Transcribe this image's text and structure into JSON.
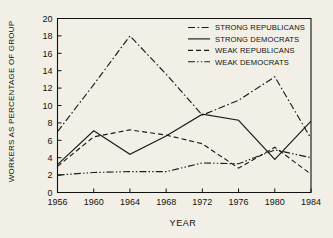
{
  "chart_data": {
    "type": "line",
    "title": "",
    "xlabel": "YEAR",
    "ylabel": "WORKERS AS PERCENTAGE OF GROUP",
    "x": [
      1956,
      1960,
      1964,
      1968,
      1972,
      1976,
      1980,
      1984
    ],
    "xlim": [
      1956,
      1984
    ],
    "ylim": [
      0,
      20
    ],
    "ytick_labels": [
      "0",
      "2",
      "4",
      "6",
      "8",
      "10",
      "12",
      "14",
      "16",
      "18",
      "20"
    ],
    "yticks": [
      0,
      2,
      4,
      6,
      8,
      10,
      12,
      14,
      16,
      18,
      20
    ],
    "xtick_labels": [
      "1956",
      "1960",
      "1964",
      "1968",
      "1972",
      "1976",
      "1980",
      "1984"
    ],
    "grid": false,
    "legend_position": "top-right",
    "series": [
      {
        "name": "STRONG REPUBLICANS",
        "dash": "dash-dot",
        "values": [
          7.0,
          12.4,
          18.0,
          13.6,
          8.9,
          10.6,
          13.3,
          6.2
        ]
      },
      {
        "name": "STRONG DEMOCRATS",
        "dash": "solid",
        "values": [
          3.2,
          7.1,
          4.4,
          6.5,
          9.0,
          8.3,
          3.8,
          8.2
        ]
      },
      {
        "name": "WEAK REPUBLICANS",
        "dash": "dashed",
        "values": [
          3.0,
          6.4,
          7.2,
          6.6,
          5.6,
          2.8,
          5.2,
          2.1
        ]
      },
      {
        "name": "WEAK DEMOCRATS",
        "dash": "dash-dot-dot",
        "values": [
          2.0,
          2.3,
          2.4,
          2.4,
          3.4,
          3.3,
          4.9,
          4.0
        ]
      }
    ]
  },
  "legend": {
    "entries": [
      {
        "label": "STRONG REPUBLICANS"
      },
      {
        "label": "STRONG DEMOCRATS"
      },
      {
        "label": "WEAK REPUBLICANS"
      },
      {
        "label": "WEAK DEMOCRATS"
      }
    ]
  },
  "colors": {
    "line": "#1a1a1a",
    "axis": "#111111",
    "plot_background": "#f2f0e6",
    "page_background": "#cfcdc6"
  }
}
